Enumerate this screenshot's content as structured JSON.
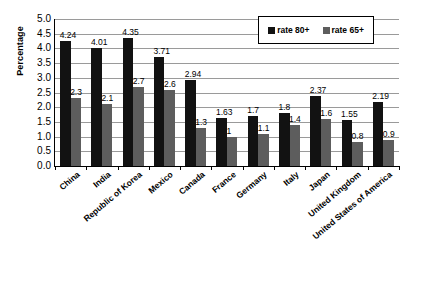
{
  "chart_data": {
    "type": "bar",
    "title": "",
    "subtitle": "",
    "xlabel": "",
    "ylabel": "Percentage",
    "ylim": [
      0,
      5.0
    ],
    "ytick_step": 0.5,
    "yticks": [
      "5.0",
      "4.5",
      "4.0",
      "3.5",
      "3.0",
      "2.5",
      "2.0",
      "1.5",
      "1.0",
      "0.5",
      "0.0"
    ],
    "grid": true,
    "legend_position": "top-right",
    "categories": [
      "China",
      "India",
      "Republic of Korea",
      "Mexico",
      "Canada",
      "France",
      "Germany",
      "Italy",
      "Japan",
      "United Kingdom",
      "United States of America"
    ],
    "series": [
      {
        "name": "rate 80+",
        "color": "#121212",
        "values": [
          4.24,
          4.01,
          4.35,
          3.71,
          2.94,
          1.63,
          1.7,
          1.8,
          2.37,
          1.55,
          2.19
        ],
        "labels": [
          "4.24",
          "4.01",
          "4.35",
          "3.71",
          "2.94",
          "1.63",
          "1.7",
          "1.8",
          "2.37",
          "1.55",
          "2.19"
        ]
      },
      {
        "name": "rate 65+",
        "color": "#5d5d5d",
        "values": [
          2.3,
          2.1,
          2.7,
          2.6,
          1.3,
          1.0,
          1.1,
          1.4,
          1.6,
          0.8,
          0.9
        ],
        "labels": [
          "2.3",
          "2.1",
          "2.7",
          "2.6",
          "1.3",
          "1",
          "1.1",
          "1.4",
          "1.6",
          "0.8",
          "0.9"
        ]
      }
    ]
  },
  "legend": {
    "items": [
      {
        "label": "rate 80+",
        "swatch": "s80"
      },
      {
        "label": "rate 65+",
        "swatch": "s65"
      }
    ]
  }
}
